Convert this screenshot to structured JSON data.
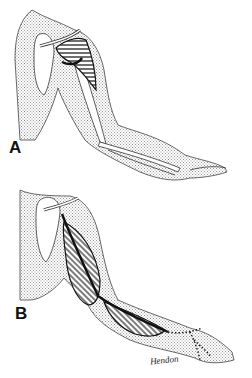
{
  "figure": {
    "panels": [
      {
        "label": "A",
        "description": "Arm with shoulder, deltoid region hatched, humerus and forearm bones outlined"
      },
      {
        "label": "B",
        "description": "Arm with hatched biceps and forearm muscles, nerve path and dotted lines to hand"
      }
    ],
    "signature": "Hendon",
    "colors": {
      "stipple": "#c8c8c8",
      "line": "#111111",
      "background": "#ffffff"
    }
  }
}
